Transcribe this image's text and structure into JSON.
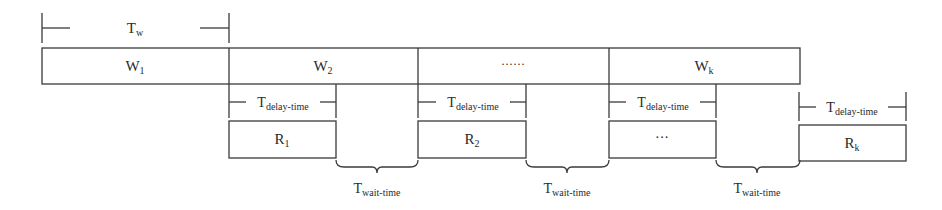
{
  "diagram": {
    "tw_label": {
      "main": "T",
      "sub": "w"
    },
    "windows": [
      {
        "main": "W",
        "sub": "1"
      },
      {
        "main": "W",
        "sub": "2"
      },
      {
        "main": "······",
        "sub": ""
      },
      {
        "main": "W",
        "sub": "k"
      }
    ],
    "delay_label": {
      "main": "T",
      "sub": "delay-time"
    },
    "results": [
      {
        "main": "R",
        "sub": "1"
      },
      {
        "main": "R",
        "sub": "2"
      },
      {
        "main": "···",
        "sub": ""
      },
      {
        "main": "R",
        "sub": "k"
      }
    ],
    "wait_label": {
      "main": "T",
      "sub": "wait-time"
    }
  },
  "colors": {
    "stroke": "#3a3a3a",
    "text": "#2a2a2a",
    "background": "#ffffff"
  }
}
